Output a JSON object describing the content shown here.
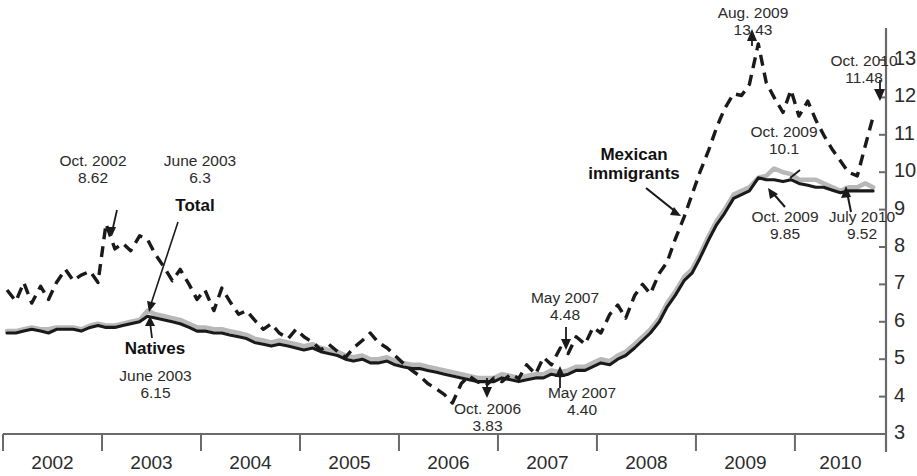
{
  "chart_data": {
    "type": "line",
    "title": "",
    "xlabel": "",
    "ylabel": "",
    "ylim": [
      3,
      13.6
    ],
    "xlim": [
      2002.0,
      2010.9
    ],
    "grid": false,
    "legend_position": "inline-annotations",
    "y_ticks": [
      "3",
      "4",
      "5",
      "6",
      "7",
      "8",
      "9",
      "10",
      "11",
      "12",
      "13"
    ],
    "x_ticks": [
      "2002",
      "2003",
      "2004",
      "2005",
      "2006",
      "2007",
      "2008",
      "2009",
      "2010"
    ],
    "series": [
      {
        "name": "Mexican immigrants",
        "style": "dashed",
        "color": "#1a1a1a",
        "x": [
          2002.04,
          2002.13,
          2002.21,
          2002.29,
          2002.38,
          2002.46,
          2002.54,
          2002.63,
          2002.71,
          2002.79,
          2002.88,
          2002.96,
          2003.04,
          2003.13,
          2003.21,
          2003.29,
          2003.38,
          2003.46,
          2003.54,
          2003.63,
          2003.71,
          2003.79,
          2003.88,
          2003.96,
          2004.04,
          2004.13,
          2004.21,
          2004.29,
          2004.38,
          2004.46,
          2004.54,
          2004.63,
          2004.71,
          2004.79,
          2004.88,
          2004.96,
          2005.04,
          2005.13,
          2005.21,
          2005.29,
          2005.38,
          2005.46,
          2005.54,
          2005.63,
          2005.71,
          2005.79,
          2005.88,
          2005.96,
          2006.04,
          2006.13,
          2006.21,
          2006.29,
          2006.38,
          2006.46,
          2006.54,
          2006.63,
          2006.71,
          2006.79,
          2006.88,
          2006.96,
          2007.04,
          2007.13,
          2007.21,
          2007.29,
          2007.38,
          2007.46,
          2007.54,
          2007.63,
          2007.71,
          2007.79,
          2007.88,
          2007.96,
          2008.04,
          2008.13,
          2008.21,
          2008.29,
          2008.38,
          2008.46,
          2008.54,
          2008.63,
          2008.71,
          2008.79,
          2008.88,
          2008.96,
          2009.04,
          2009.13,
          2009.21,
          2009.29,
          2009.38,
          2009.46,
          2009.54,
          2009.63,
          2009.71,
          2009.79,
          2009.88,
          2009.96,
          2010.04,
          2010.13,
          2010.21,
          2010.29,
          2010.38,
          2010.46,
          2010.54,
          2010.63,
          2010.71,
          2010.79
        ],
        "values": [
          6.85,
          6.55,
          7.05,
          6.5,
          6.95,
          6.6,
          7.05,
          7.4,
          7.1,
          7.25,
          7.35,
          7.05,
          8.62,
          7.95,
          8.1,
          7.9,
          8.3,
          8.2,
          7.8,
          7.45,
          7.1,
          7.4,
          7.0,
          6.6,
          6.85,
          6.3,
          6.9,
          6.55,
          6.2,
          6.3,
          6.05,
          5.8,
          5.95,
          5.7,
          5.55,
          5.8,
          5.6,
          5.45,
          5.25,
          5.4,
          5.2,
          5.05,
          5.3,
          5.5,
          5.7,
          5.45,
          5.3,
          5.1,
          4.9,
          4.7,
          4.55,
          4.35,
          4.2,
          4.05,
          3.83,
          4.35,
          4.55,
          4.4,
          4.3,
          4.5,
          4.4,
          4.6,
          4.48,
          4.85,
          4.6,
          5.05,
          4.85,
          5.3,
          5.15,
          5.6,
          5.4,
          5.85,
          5.7,
          6.2,
          6.45,
          6.1,
          6.7,
          7.0,
          6.75,
          7.3,
          7.6,
          8.2,
          8.8,
          9.4,
          10.0,
          10.6,
          11.2,
          11.7,
          12.1,
          12.05,
          12.35,
          13.43,
          12.4,
          12.0,
          11.6,
          12.2,
          11.5,
          11.9,
          11.4,
          11.0,
          10.6,
          10.3,
          10.0,
          9.9,
          10.7,
          11.48
        ]
      },
      {
        "name": "Total",
        "style": "solid",
        "color": "#b8b8b8",
        "x": [
          2002.04,
          2002.13,
          2002.21,
          2002.29,
          2002.38,
          2002.46,
          2002.54,
          2002.63,
          2002.71,
          2002.79,
          2002.88,
          2002.96,
          2003.04,
          2003.13,
          2003.21,
          2003.29,
          2003.38,
          2003.46,
          2003.54,
          2003.63,
          2003.71,
          2003.79,
          2003.88,
          2003.96,
          2004.04,
          2004.13,
          2004.21,
          2004.29,
          2004.38,
          2004.46,
          2004.54,
          2004.63,
          2004.71,
          2004.79,
          2004.88,
          2004.96,
          2005.04,
          2005.13,
          2005.21,
          2005.29,
          2005.38,
          2005.46,
          2005.54,
          2005.63,
          2005.71,
          2005.79,
          2005.88,
          2005.96,
          2006.04,
          2006.13,
          2006.21,
          2006.29,
          2006.38,
          2006.46,
          2006.54,
          2006.63,
          2006.71,
          2006.79,
          2006.88,
          2006.96,
          2007.04,
          2007.13,
          2007.21,
          2007.29,
          2007.38,
          2007.46,
          2007.54,
          2007.63,
          2007.71,
          2007.79,
          2007.88,
          2007.96,
          2008.04,
          2008.13,
          2008.21,
          2008.29,
          2008.38,
          2008.46,
          2008.54,
          2008.63,
          2008.71,
          2008.79,
          2008.88,
          2008.96,
          2009.04,
          2009.13,
          2009.21,
          2009.29,
          2009.38,
          2009.46,
          2009.54,
          2009.63,
          2009.71,
          2009.79,
          2009.88,
          2009.96,
          2010.04,
          2010.13,
          2010.21,
          2010.29,
          2010.38,
          2010.46,
          2010.54,
          2010.63,
          2010.71,
          2010.79
        ],
        "values": [
          5.75,
          5.75,
          5.8,
          5.85,
          5.8,
          5.8,
          5.85,
          5.85,
          5.85,
          5.8,
          5.9,
          5.95,
          5.9,
          5.9,
          5.95,
          6.0,
          6.05,
          6.3,
          6.2,
          6.15,
          6.1,
          6.05,
          5.95,
          5.85,
          5.85,
          5.8,
          5.8,
          5.75,
          5.7,
          5.65,
          5.55,
          5.5,
          5.45,
          5.5,
          5.45,
          5.4,
          5.35,
          5.4,
          5.3,
          5.25,
          5.2,
          5.1,
          5.05,
          5.1,
          5.0,
          5.0,
          5.05,
          4.95,
          4.9,
          4.85,
          4.85,
          4.8,
          4.75,
          4.7,
          4.65,
          4.6,
          4.55,
          4.5,
          4.5,
          4.5,
          4.6,
          4.55,
          4.5,
          4.55,
          4.6,
          4.6,
          4.7,
          4.65,
          4.7,
          4.8,
          4.8,
          4.9,
          5.0,
          4.95,
          5.1,
          5.2,
          5.4,
          5.6,
          5.8,
          6.1,
          6.5,
          6.8,
          7.2,
          7.4,
          7.8,
          8.3,
          8.7,
          9.0,
          9.4,
          9.5,
          9.6,
          9.85,
          9.9,
          10.1,
          10.0,
          9.95,
          9.8,
          9.8,
          9.8,
          9.7,
          9.6,
          9.5,
          9.6,
          9.6,
          9.7,
          9.6
        ]
      },
      {
        "name": "Natives",
        "style": "solid",
        "color": "#1a1a1a",
        "x": [
          2002.04,
          2002.13,
          2002.21,
          2002.29,
          2002.38,
          2002.46,
          2002.54,
          2002.63,
          2002.71,
          2002.79,
          2002.88,
          2002.96,
          2003.04,
          2003.13,
          2003.21,
          2003.29,
          2003.38,
          2003.46,
          2003.54,
          2003.63,
          2003.71,
          2003.79,
          2003.88,
          2003.96,
          2004.04,
          2004.13,
          2004.21,
          2004.29,
          2004.38,
          2004.46,
          2004.54,
          2004.63,
          2004.71,
          2004.79,
          2004.88,
          2004.96,
          2005.04,
          2005.13,
          2005.21,
          2005.29,
          2005.38,
          2005.46,
          2005.54,
          2005.63,
          2005.71,
          2005.79,
          2005.88,
          2005.96,
          2006.04,
          2006.13,
          2006.21,
          2006.29,
          2006.38,
          2006.46,
          2006.54,
          2006.63,
          2006.71,
          2006.79,
          2006.88,
          2006.96,
          2007.04,
          2007.13,
          2007.21,
          2007.29,
          2007.38,
          2007.46,
          2007.54,
          2007.63,
          2007.71,
          2007.79,
          2007.88,
          2007.96,
          2008.04,
          2008.13,
          2008.21,
          2008.29,
          2008.38,
          2008.46,
          2008.54,
          2008.63,
          2008.71,
          2008.79,
          2008.88,
          2008.96,
          2009.04,
          2009.13,
          2009.21,
          2009.29,
          2009.38,
          2009.46,
          2009.54,
          2009.63,
          2009.71,
          2009.79,
          2009.88,
          2009.96,
          2010.04,
          2010.13,
          2010.21,
          2010.29,
          2010.38,
          2010.46,
          2010.54,
          2010.63,
          2010.71,
          2010.79
        ],
        "values": [
          5.7,
          5.7,
          5.75,
          5.8,
          5.75,
          5.7,
          5.8,
          5.8,
          5.8,
          5.75,
          5.85,
          5.9,
          5.85,
          5.85,
          5.9,
          5.95,
          6.0,
          6.15,
          6.1,
          6.05,
          6.0,
          5.95,
          5.85,
          5.75,
          5.75,
          5.7,
          5.7,
          5.65,
          5.6,
          5.55,
          5.45,
          5.4,
          5.35,
          5.4,
          5.35,
          5.3,
          5.25,
          5.3,
          5.2,
          5.15,
          5.1,
          5.0,
          4.95,
          5.0,
          4.9,
          4.9,
          4.95,
          4.85,
          4.8,
          4.75,
          4.75,
          4.7,
          4.65,
          4.6,
          4.55,
          4.5,
          4.45,
          4.4,
          4.4,
          4.4,
          4.5,
          4.45,
          4.4,
          4.45,
          4.5,
          4.5,
          4.6,
          4.55,
          4.6,
          4.7,
          4.7,
          4.8,
          4.9,
          4.85,
          5.0,
          5.1,
          5.3,
          5.5,
          5.7,
          6.0,
          6.4,
          6.7,
          7.1,
          7.3,
          7.7,
          8.2,
          8.6,
          8.9,
          9.3,
          9.4,
          9.5,
          9.85,
          9.8,
          9.8,
          9.75,
          9.8,
          9.7,
          9.65,
          9.6,
          9.6,
          9.52,
          9.45,
          9.5,
          9.5,
          9.5,
          9.5
        ]
      }
    ],
    "annotations": [
      {
        "id": "oct-2002",
        "date": "Oct. 2002",
        "value": "8.62",
        "series": "Mexican immigrants"
      },
      {
        "id": "june-2003-total",
        "date": "June 2003",
        "value": "6.3",
        "series": "Total"
      },
      {
        "id": "june-2003-natives",
        "date": "June 2003",
        "value": "6.15",
        "series": "Natives"
      },
      {
        "id": "oct-2006",
        "date": "Oct. 2006",
        "value": "3.83",
        "series": "Mexican immigrants"
      },
      {
        "id": "may-2007-mex",
        "date": "May 2007",
        "value": "4.48",
        "series": "Mexican immigrants"
      },
      {
        "id": "may-2007-nat",
        "date": "May 2007",
        "value": "4.40",
        "series": "Natives"
      },
      {
        "id": "aug-2009",
        "date": "Aug. 2009",
        "value": "13.43",
        "series": "Mexican immigrants"
      },
      {
        "id": "oct-2009-mex",
        "date": "Oct. 2009",
        "value": "10.1",
        "series": "Total"
      },
      {
        "id": "oct-2009-nat",
        "date": "Oct. 2009",
        "value": "9.85",
        "series": "Natives"
      },
      {
        "id": "july-2010",
        "date": "July 2010",
        "value": "9.52",
        "series": "Natives"
      },
      {
        "id": "oct-2010",
        "date": "Oct. 2010",
        "value": "11.48",
        "series": "Mexican immigrants"
      }
    ]
  },
  "series_labels": {
    "mexican": "Mexican\nimmigrants",
    "mexican_line1": "Mexican",
    "mexican_line2": "immigrants",
    "total": "Total",
    "natives": "Natives"
  },
  "axes": {
    "y_ticks": [
      "13",
      "12",
      "11",
      "10",
      "9",
      "8",
      "7",
      "6",
      "5",
      "4",
      "3"
    ],
    "x_ticks": [
      "2002",
      "2003",
      "2004",
      "2005",
      "2006",
      "2007",
      "2008",
      "2009",
      "2010"
    ]
  },
  "annotation_text": {
    "oct2002_date": "Oct. 2002",
    "oct2002_value": "8.62",
    "june2003_total_date": "June 2003",
    "june2003_total_value": "6.3",
    "june2003_nat_date": "June 2003",
    "june2003_nat_value": "6.15",
    "oct2006_date": "Oct. 2006",
    "oct2006_value": "3.83",
    "may2007_mex_date": "May 2007",
    "may2007_mex_value": "4.48",
    "may2007_nat_date": "May 2007",
    "may2007_nat_value": "4.40",
    "aug2009_date": "Aug. 2009",
    "aug2009_value": "13.43",
    "oct2009_mex_date": "Oct. 2009",
    "oct2009_mex_value": "10.1",
    "oct2009_nat_date": "Oct. 2009",
    "oct2009_nat_value": "9.85",
    "july2010_date": "July 2010",
    "july2010_value": "9.52",
    "oct2010_date": "Oct. 2010",
    "oct2010_value": "11.48"
  },
  "colors": {
    "line_dark": "#1a1a1a",
    "line_gray": "#b8b8b8",
    "axis": "#6a6a6a",
    "text": "#2b2b2b"
  }
}
